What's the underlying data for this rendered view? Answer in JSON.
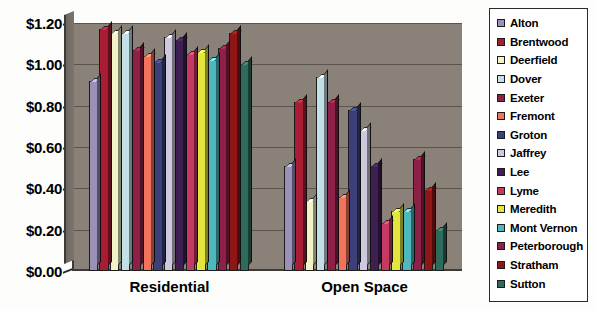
{
  "chart_data": {
    "type": "bar",
    "title": "",
    "subtitle": "",
    "xlabel": "",
    "ylabel": "",
    "categories": [
      "Residential",
      "Open Space"
    ],
    "ylim": [
      0.0,
      1.2
    ],
    "ytick_values": [
      0.0,
      0.2,
      0.4,
      0.6,
      0.8,
      1.0,
      1.2
    ],
    "ytick_labels": [
      "$0.00",
      "$0.20",
      "$0.40",
      "$0.60",
      "$0.80",
      "$1.00",
      "$1.20"
    ],
    "grid": true,
    "legend_position": "right",
    "series": [
      {
        "name": "Alton",
        "color": "#9a90b8",
        "values": [
          0.92,
          0.51
        ]
      },
      {
        "name": "Brentwood",
        "color": "#a81d33",
        "values": [
          1.17,
          0.82
        ]
      },
      {
        "name": "Deerfield",
        "color": "#f2f2c8",
        "values": [
          1.15,
          0.34
        ]
      },
      {
        "name": "Dover",
        "color": "#c3e0e6",
        "values": [
          1.15,
          0.94
        ]
      },
      {
        "name": "Exeter",
        "color": "#8e1f46",
        "values": [
          1.07,
          0.82
        ]
      },
      {
        "name": "Fremont",
        "color": "#f2735c",
        "values": [
          1.04,
          0.36
        ]
      },
      {
        "name": "Groton",
        "color": "#3c3f79",
        "values": [
          1.01,
          0.78
        ]
      },
      {
        "name": "Jaffrey",
        "color": "#cfc9e0",
        "values": [
          1.13,
          0.68
        ]
      },
      {
        "name": "Lee",
        "color": "#3e1f52",
        "values": [
          1.12,
          0.51
        ]
      },
      {
        "name": "Lyme",
        "color": "#c43a63",
        "values": [
          1.05,
          0.23
        ]
      },
      {
        "name": "Meredith",
        "color": "#e3e63c",
        "values": [
          1.06,
          0.29
        ]
      },
      {
        "name": "Mont Vernon",
        "color": "#4fb8bd",
        "values": [
          1.02,
          0.29
        ]
      },
      {
        "name": "Peterborough",
        "color": "#8e1f46",
        "values": [
          1.08,
          0.54
        ]
      },
      {
        "name": "Stratham",
        "color": "#8f1616",
        "values": [
          1.15,
          0.39
        ]
      },
      {
        "name": "Sutton",
        "color": "#2f6b5a",
        "values": [
          1.0,
          0.2
        ]
      }
    ]
  },
  "legend": {
    "items": [
      {
        "label": "Alton"
      },
      {
        "label": "Brentwood"
      },
      {
        "label": "Deerfield"
      },
      {
        "label": "Dover"
      },
      {
        "label": "Exeter"
      },
      {
        "label": "Fremont"
      },
      {
        "label": "Groton"
      },
      {
        "label": "Jaffrey"
      },
      {
        "label": "Lee"
      },
      {
        "label": "Lyme"
      },
      {
        "label": "Meredith"
      },
      {
        "label": "Mont Vernon"
      },
      {
        "label": "Peterborough"
      },
      {
        "label": "Stratham"
      },
      {
        "label": "Sutton"
      }
    ]
  }
}
